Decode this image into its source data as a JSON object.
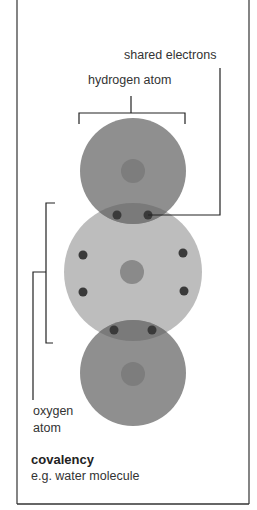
{
  "labels": {
    "shared_electrons": "shared electrons",
    "hydrogen_atom": "hydrogen atom",
    "oxygen_atom_line1": "oxygen",
    "oxygen_atom_line2": "atom"
  },
  "caption": {
    "title": "covalency",
    "subtitle": "e.g. water molecule"
  },
  "colors": {
    "hydrogen_shell": "#8f8f8f",
    "oxygen_shell": "#bdbdbd",
    "overlap": "#7a7a7a",
    "nucleus": "#7d7d7d",
    "electron": "#3a3a3a",
    "line": "#222222",
    "frame": "#333333"
  },
  "molecule": {
    "atoms": [
      {
        "name": "hydrogen",
        "cx": 133,
        "cy": 171,
        "r": 53
      },
      {
        "name": "oxygen",
        "cx": 133,
        "cy": 272,
        "r": 69
      },
      {
        "name": "hydrogen",
        "cx": 133,
        "cy": 373,
        "r": 53
      }
    ],
    "electrons": [
      {
        "x": 117,
        "y": 215
      },
      {
        "x": 148,
        "y": 215
      },
      {
        "x": 83,
        "y": 255
      },
      {
        "x": 183,
        "y": 253
      },
      {
        "x": 83,
        "y": 292
      },
      {
        "x": 184,
        "y": 291
      },
      {
        "x": 114,
        "y": 330
      },
      {
        "x": 152,
        "y": 330
      }
    ]
  }
}
